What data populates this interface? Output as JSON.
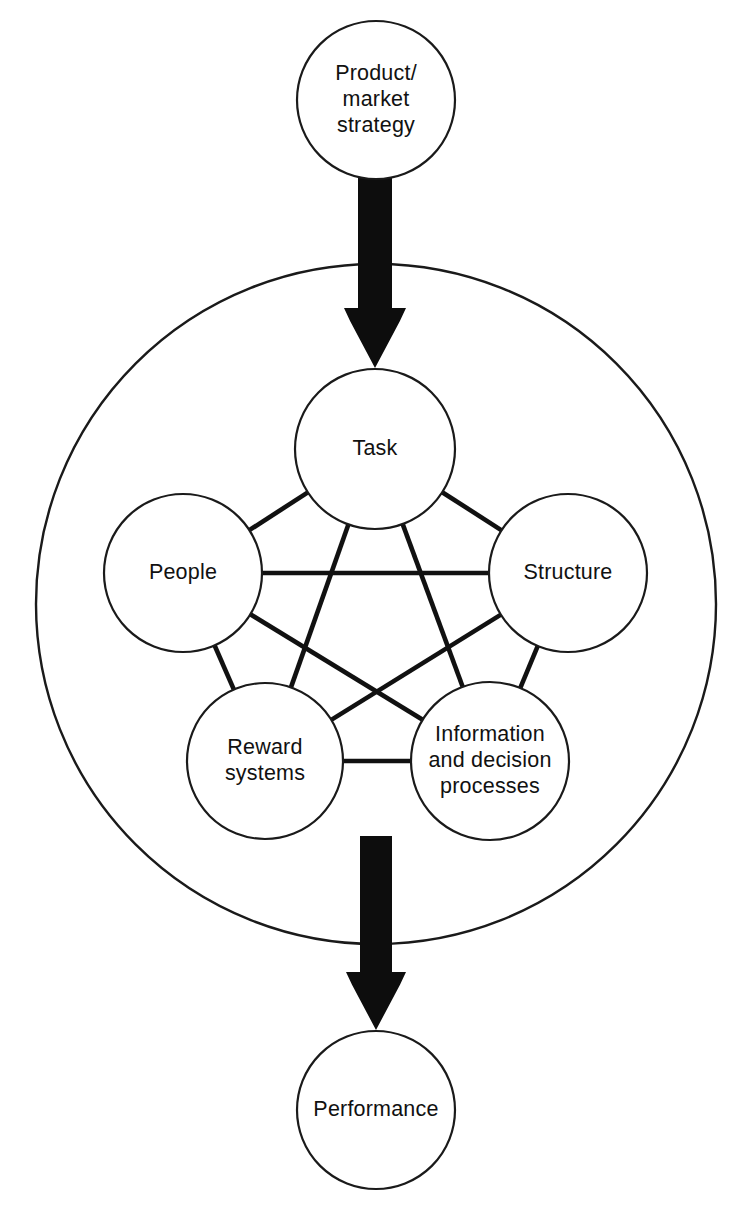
{
  "diagram": {
    "type": "node-link-diagram",
    "background_color": "#ffffff",
    "line_color": "#111111",
    "arrow_color": "#0d0d0d",
    "nodes": [
      {
        "id": "product_market_strategy",
        "lines": [
          "Product/",
          "market",
          "strategy"
        ],
        "cx": 376,
        "cy": 100,
        "r": 79,
        "group": "input"
      },
      {
        "id": "task",
        "lines": [
          "Task"
        ],
        "cx": 375,
        "cy": 449,
        "r": 80,
        "group": "star"
      },
      {
        "id": "people",
        "lines": [
          "People"
        ],
        "cx": 183,
        "cy": 573,
        "r": 79,
        "group": "star"
      },
      {
        "id": "structure",
        "lines": [
          "Structure"
        ],
        "cx": 568,
        "cy": 573,
        "r": 79,
        "group": "star"
      },
      {
        "id": "reward_systems",
        "lines": [
          "Reward",
          "systems"
        ],
        "cx": 265,
        "cy": 761,
        "r": 78,
        "group": "star"
      },
      {
        "id": "information_and_decision_processes",
        "lines": [
          "Information",
          "and decision",
          "processes"
        ],
        "cx": 490,
        "cy": 761,
        "r": 79,
        "group": "star"
      },
      {
        "id": "performance",
        "lines": [
          "Performance"
        ],
        "cx": 376,
        "cy": 1110,
        "r": 79,
        "group": "output"
      }
    ],
    "boundary": {
      "id": "organization_boundary",
      "cx": 376,
      "cy": 604,
      "r": 340
    },
    "links": [
      {
        "from": "task",
        "to": "people"
      },
      {
        "from": "task",
        "to": "structure"
      },
      {
        "from": "task",
        "to": "reward_systems"
      },
      {
        "from": "task",
        "to": "information_and_decision_processes"
      },
      {
        "from": "people",
        "to": "structure"
      },
      {
        "from": "people",
        "to": "reward_systems"
      },
      {
        "from": "people",
        "to": "information_and_decision_processes"
      },
      {
        "from": "structure",
        "to": "reward_systems"
      },
      {
        "from": "structure",
        "to": "information_and_decision_processes"
      },
      {
        "from": "reward_systems",
        "to": "information_and_decision_processes"
      }
    ],
    "arrows": [
      {
        "id": "strategy-to-task-arrow",
        "from": "product_market_strategy",
        "to": "task",
        "direction": "down",
        "x_center": 375,
        "y_start": 176,
        "y_tip": 368,
        "shaft_half_width": 17,
        "head_half_width": 31,
        "head_length": 60
      },
      {
        "id": "organization-to-performance-arrow",
        "from": "organization_boundary",
        "to": "performance",
        "direction": "down",
        "x_center": 376,
        "y_start": 836,
        "y_tip": 1030,
        "shaft_half_width": 16,
        "head_half_width": 30,
        "head_length": 58
      }
    ]
  }
}
